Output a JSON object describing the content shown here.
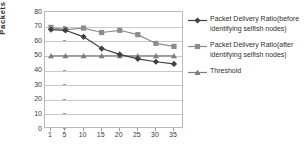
{
  "chart_data": {
    "type": "line",
    "title": "",
    "xlabel": "",
    "ylabel": "Packets",
    "x": [
      1,
      5,
      10,
      15,
      20,
      25,
      30,
      35
    ],
    "xtick_labels": [
      "1",
      "5",
      "10",
      "15",
      "20",
      "25",
      "30",
      "35"
    ],
    "ytick_labels": [
      "0",
      "10",
      "20",
      "30",
      "40",
      "50",
      "60",
      "70",
      "80"
    ],
    "ylim": [
      0,
      80
    ],
    "ytick_step": 10,
    "grid": "horizontal",
    "legend_position": "right",
    "series": [
      {
        "name": "Packet Delivery Ratio(before identifying selfish nodes)",
        "marker": "diamond",
        "color": "#404040",
        "values": [
          68,
          67.5,
          63,
          55,
          51,
          48,
          46,
          44.5
        ]
      },
      {
        "name": "Packet Delivery Ratio(after identifying selfish nodes)",
        "marker": "square",
        "color": "#8c8c8c",
        "values": [
          69.5,
          68,
          69,
          66,
          67.5,
          64.5,
          58.5,
          56.5
        ]
      },
      {
        "name": "Threshold",
        "marker": "triangle",
        "color": "#7d7d7d",
        "values": [
          50,
          50,
          50,
          50,
          50,
          50,
          50,
          50
        ]
      }
    ]
  },
  "axes": {
    "y_label": "Packets"
  },
  "legend": {
    "entries": [
      {
        "label": "Packet Delivery Ratio(before identifying selfish nodes)"
      },
      {
        "label": "Packet Delivery Ratio(after identifying selfish nodes)"
      },
      {
        "label": "Threshold"
      }
    ]
  },
  "colors": {
    "series1": "#404040",
    "series2": "#8c8c8c",
    "series3": "#7d7d7d",
    "grid": "#c9c9c9",
    "border": "#b9b9b9",
    "background": "#ffffff"
  }
}
